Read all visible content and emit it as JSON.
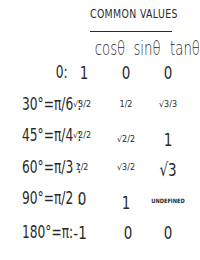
{
  "title": "COMMON VALUES",
  "headers": {
    "cos": "cosθ",
    "sin": "sinθ",
    "tan": "tanθ"
  },
  "rows": [
    {
      "angle": "0:",
      "cos": "1",
      "sin": "0",
      "tan": "0"
    },
    {
      "angle": "30°=π/6 :",
      "cos": "√3/2",
      "sin": "1/2",
      "tan": "√3/3"
    },
    {
      "angle": "45°=π/4 :",
      "cos": "√2/2",
      "sin": "√2/2",
      "tan": "1"
    },
    {
      "angle": "60°=π/3 :",
      "cos": "1/2",
      "sin": "√3/2",
      "tan": "√3"
    },
    {
      "angle": "90°=π/2 :",
      "cos": "0",
      "sin": "1",
      "tan": "UNDEFINED"
    },
    {
      "angle": "180°=π:",
      "cos": "-1",
      "sin": "0",
      "tan": "0"
    }
  ]
}
